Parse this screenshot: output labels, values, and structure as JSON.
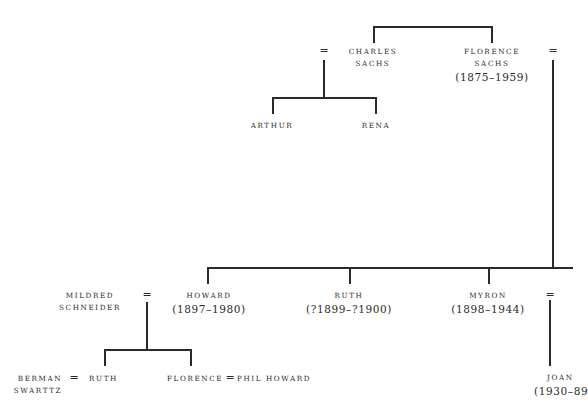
{
  "diagram": {
    "type": "family-tree",
    "marriage_symbol": "=",
    "generation_1": {
      "couple": [
        {
          "id": "charles",
          "name_line1": "CHARLES",
          "name_line2": "SACHS",
          "dates": ""
        },
        {
          "id": "florence-sachs",
          "name_line1": "FLORENCE",
          "name_line2": "SACHS",
          "dates": "(1875–1959)"
        }
      ]
    },
    "charles_children": [
      {
        "id": "arthur",
        "name": "ARTHUR"
      },
      {
        "id": "rena",
        "name": "RENA"
      }
    ],
    "florence_children": [
      {
        "id": "howard",
        "name": "HOWARD",
        "dates": "(1897–1980)"
      },
      {
        "id": "ruth",
        "name": "RUTH",
        "dates": "(?1899–?1900)"
      },
      {
        "id": "myron",
        "name": "MYRON",
        "dates": "(1898–1944)"
      }
    ],
    "howard_spouse": {
      "name_line1": "MILDRED",
      "name_line2": "SCHNEIDER"
    },
    "howard_children": [
      {
        "id": "ruth-2",
        "name": "RUTH",
        "spouse": {
          "name_line1": "BERMAN",
          "name_line2": "SWARTTZ"
        }
      },
      {
        "id": "florence-2",
        "name": "FLORENCE",
        "spouse": {
          "name": "PHIL HOWARD"
        }
      }
    ],
    "myron_children": [
      {
        "id": "joan",
        "name": "JOAN",
        "dates": "(1930–89"
      }
    ]
  }
}
